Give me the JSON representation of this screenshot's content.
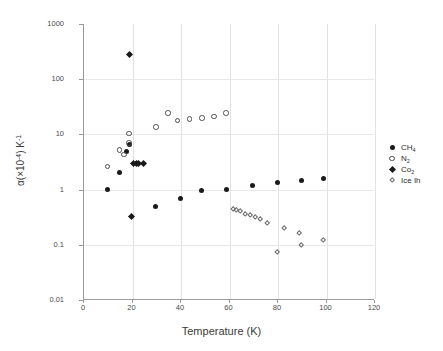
{
  "chart_data": {
    "type": "scatter",
    "title": "",
    "xlabel": "Temperature (K)",
    "ylabel": "α(×10⁻⁴) K⁻¹",
    "ylabel_parts": {
      "alpha": "α(×10",
      "exp1": "-4",
      "mid": ") K",
      "exp2": "-1"
    },
    "xlim": [
      0,
      120
    ],
    "ylim": [
      0.01,
      1000
    ],
    "yscale": "log",
    "xscale": "linear",
    "grid": "vertical-and-horizontal-light",
    "legend_position": "right-outside",
    "xticks": [
      0,
      20,
      40,
      60,
      80,
      100,
      120
    ],
    "xtick_labels": [
      "0",
      "20",
      "40",
      "60",
      "80",
      "100",
      "120"
    ],
    "yticks": [
      0.01,
      0.1,
      1,
      10,
      100,
      1000
    ],
    "ytick_labels": [
      "0.01",
      "0.1",
      "1",
      "10",
      "100",
      "1000"
    ],
    "series": [
      {
        "name": "CH4",
        "label": "CH₄",
        "marker": "filled-circle",
        "color": "#1a1a1a",
        "points": [
          {
            "x": 10,
            "y": 1.0
          },
          {
            "x": 15,
            "y": 2.0
          },
          {
            "x": 18,
            "y": 5.0
          },
          {
            "x": 19,
            "y": 6.6
          },
          {
            "x": 30,
            "y": 0.5
          },
          {
            "x": 40,
            "y": 0.68
          },
          {
            "x": 49,
            "y": 0.95
          },
          {
            "x": 59,
            "y": 1.0
          },
          {
            "x": 70,
            "y": 1.17
          },
          {
            "x": 80,
            "y": 1.33
          },
          {
            "x": 90,
            "y": 1.45
          },
          {
            "x": 99,
            "y": 1.58
          }
        ]
      },
      {
        "name": "N2",
        "label": "N₂",
        "marker": "open-circle",
        "color": "#4f4f4f",
        "points": [
          {
            "x": 10,
            "y": 2.6
          },
          {
            "x": 15,
            "y": 5.2
          },
          {
            "x": 17,
            "y": 4.3
          },
          {
            "x": 19,
            "y": 7.0
          },
          {
            "x": 19,
            "y": 10.3
          },
          {
            "x": 30,
            "y": 13.5
          },
          {
            "x": 35,
            "y": 24.5
          },
          {
            "x": 39,
            "y": 17.8
          },
          {
            "x": 44,
            "y": 19.0
          },
          {
            "x": 49,
            "y": 20.0
          },
          {
            "x": 54,
            "y": 21.0
          },
          {
            "x": 59,
            "y": 24.5
          }
        ]
      },
      {
        "name": "CO2",
        "label": "Co₂",
        "marker": "filled-diamond",
        "color": "#1a1a1a",
        "points": [
          {
            "x": 19,
            "y": 280.0
          },
          {
            "x": 20,
            "y": 0.32
          },
          {
            "x": 21,
            "y": 3.0
          },
          {
            "x": 22,
            "y": 3.0
          },
          {
            "x": 23,
            "y": 3.0
          },
          {
            "x": 25,
            "y": 3.0
          }
        ]
      },
      {
        "name": "Ice Ih",
        "label": "Ice Ih",
        "marker": "open-diamond",
        "color": "#6a6a6a",
        "points": [
          {
            "x": 62,
            "y": 0.44
          },
          {
            "x": 63,
            "y": 0.43
          },
          {
            "x": 65,
            "y": 0.4
          },
          {
            "x": 67,
            "y": 0.36
          },
          {
            "x": 69,
            "y": 0.34
          },
          {
            "x": 71,
            "y": 0.31
          },
          {
            "x": 73,
            "y": 0.29
          },
          {
            "x": 76,
            "y": 0.245
          },
          {
            "x": 80,
            "y": 0.075
          },
          {
            "x": 83,
            "y": 0.2
          },
          {
            "x": 89,
            "y": 0.165
          },
          {
            "x": 90,
            "y": 0.1
          },
          {
            "x": 99,
            "y": 0.122
          }
        ]
      }
    ]
  },
  "legend": {
    "entries": [
      {
        "label_html": "CH<sub>4</sub>",
        "marker": "filled-circle",
        "name": "CH4"
      },
      {
        "label_html": "N<sub>2</sub>",
        "marker": "open-circle",
        "name": "N2"
      },
      {
        "label_html": "Co<sub>2</sub>",
        "marker": "filled-diamond",
        "name": "CO2"
      },
      {
        "label_html": "Ice Ih",
        "marker": "open-diamond",
        "name": "Ice Ih"
      }
    ]
  }
}
